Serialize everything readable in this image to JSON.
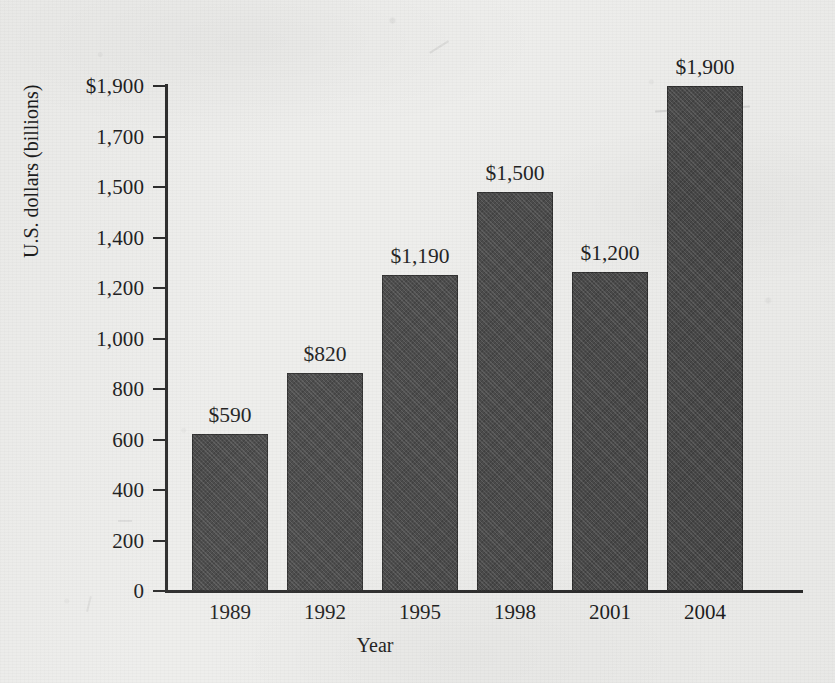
{
  "chart_data": {
    "type": "bar",
    "title": "",
    "xlabel": "Year",
    "ylabel": "U.S. dollars (billions)",
    "categories": [
      "1989",
      "1992",
      "1995",
      "1998",
      "2001",
      "2004"
    ],
    "values": [
      590,
      820,
      1190,
      1500,
      1200,
      1900
    ],
    "value_labels": [
      "$590",
      "$820",
      "$1,190",
      "$1,500",
      "$1,200",
      "$1,900"
    ],
    "ylim": [
      0,
      1900
    ],
    "grid": false,
    "legend": null,
    "y_tick_labels": [
      "0",
      "200",
      "400",
      "600",
      "800",
      "1,000",
      "1,200",
      "1,400",
      "1,500",
      "1,700",
      "$1,900"
    ],
    "y_tick_values": [
      0,
      200,
      400,
      600,
      800,
      1000,
      1200,
      1400,
      1500,
      1700,
      1900
    ],
    "bar_color": "#474747",
    "axis_color": "#2a2a2a",
    "background_color": "#eeeeec"
  }
}
